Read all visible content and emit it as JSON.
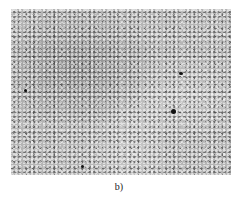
{
  "figure": {
    "subfigure_label": "b)",
    "image_description": "grayscale micrograph of granular microstructure"
  }
}
